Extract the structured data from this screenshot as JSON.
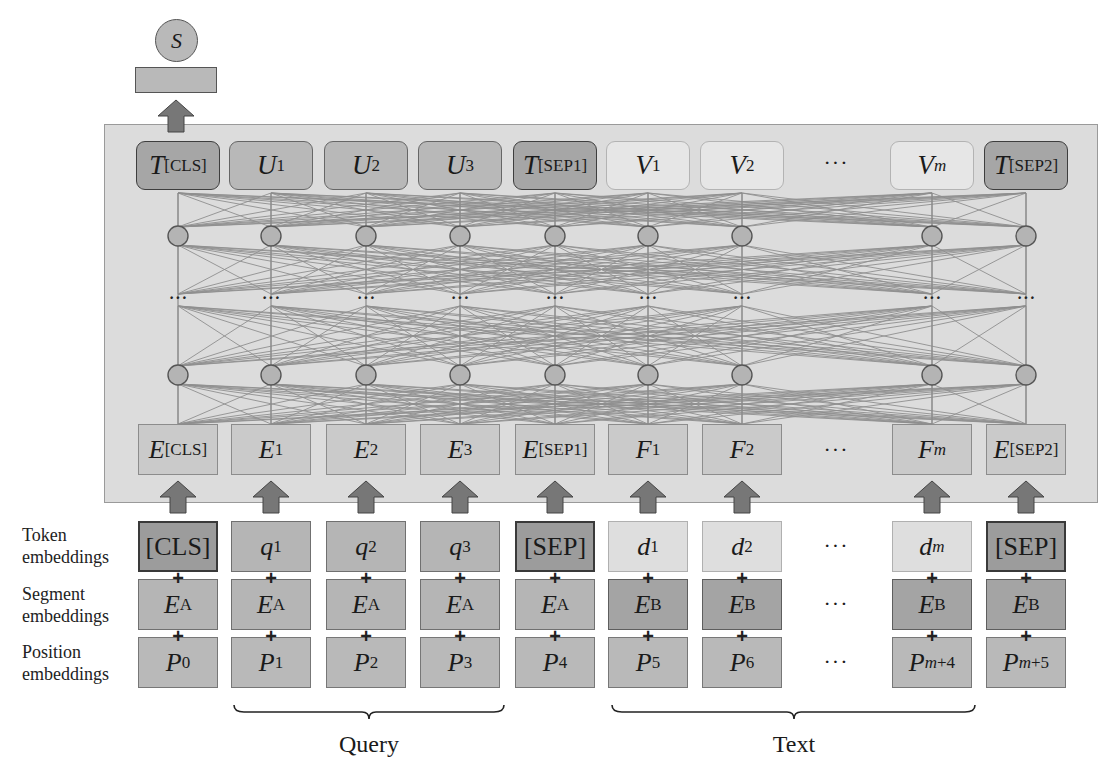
{
  "figure": {
    "output": {
      "score_label": "S"
    },
    "colors": {
      "container_bg": "#dcdcdc",
      "arrow": "#777777",
      "edge": "#8a8a8a",
      "node": "#b4b4b4"
    },
    "output_tokens": [
      {
        "main": "T",
        "sub": "[CLS]",
        "sub_italic": false,
        "shade": "dark"
      },
      {
        "main": "U",
        "sub": "1",
        "sub_italic": false,
        "shade": "mid"
      },
      {
        "main": "U",
        "sub": "2",
        "sub_italic": false,
        "shade": "mid"
      },
      {
        "main": "U",
        "sub": "3",
        "sub_italic": false,
        "shade": "mid"
      },
      {
        "main": "T",
        "sub": "[SEP1]",
        "sub_italic": false,
        "shade": "dark"
      },
      {
        "main": "V",
        "sub": "1",
        "sub_italic": false,
        "shade": "light"
      },
      {
        "main": "V",
        "sub": "2",
        "sub_italic": false,
        "shade": "light"
      },
      {
        "main": "V",
        "sub": "m",
        "sub_italic": true,
        "shade": "light"
      },
      {
        "main": "T",
        "sub": "[SEP2]",
        "sub_italic": false,
        "shade": "dark"
      }
    ],
    "input_embeddings_E": [
      {
        "main": "E",
        "sub": "[CLS]",
        "sub_italic": false
      },
      {
        "main": "E",
        "sub": "1",
        "sub_italic": false
      },
      {
        "main": "E",
        "sub": "2",
        "sub_italic": false
      },
      {
        "main": "E",
        "sub": "3",
        "sub_italic": false
      },
      {
        "main": "E",
        "sub": "[SEP1]",
        "sub_italic": false
      },
      {
        "main": "F",
        "sub": "1",
        "sub_italic": false
      },
      {
        "main": "F",
        "sub": "2",
        "sub_italic": false
      },
      {
        "main": "F",
        "sub": "m",
        "sub_italic": true
      },
      {
        "main": "E",
        "sub": "[SEP2]",
        "sub_italic": false
      }
    ],
    "ellipsis": "···",
    "row_labels": {
      "token": [
        "Token",
        "embeddings"
      ],
      "segment": [
        "Segment",
        "embeddings"
      ],
      "position": [
        "Position",
        "embeddings"
      ]
    },
    "token_embeddings": [
      {
        "main": "[CLS]",
        "sub": "",
        "italic": false,
        "shade": "dark"
      },
      {
        "main": "q",
        "sub": "1",
        "italic": true,
        "shade": "mid"
      },
      {
        "main": "q",
        "sub": "2",
        "italic": true,
        "shade": "mid"
      },
      {
        "main": "q",
        "sub": "3",
        "italic": true,
        "shade": "mid"
      },
      {
        "main": "[SEP]",
        "sub": "",
        "italic": false,
        "shade": "dark"
      },
      {
        "main": "d",
        "sub": "1",
        "italic": true,
        "shade": "light"
      },
      {
        "main": "d",
        "sub": "2",
        "italic": true,
        "shade": "light"
      },
      {
        "main": "d",
        "sub": "m",
        "italic": true,
        "sub_italic": true,
        "shade": "light"
      },
      {
        "main": "[SEP]",
        "sub": "",
        "italic": false,
        "shade": "dark"
      }
    ],
    "segment_embeddings": [
      {
        "main": "E",
        "sub": "A",
        "seg": "a"
      },
      {
        "main": "E",
        "sub": "A",
        "seg": "a"
      },
      {
        "main": "E",
        "sub": "A",
        "seg": "a"
      },
      {
        "main": "E",
        "sub": "A",
        "seg": "a"
      },
      {
        "main": "E",
        "sub": "A",
        "seg": "a"
      },
      {
        "main": "E",
        "sub": "B",
        "seg": "b"
      },
      {
        "main": "E",
        "sub": "B",
        "seg": "b"
      },
      {
        "main": "E",
        "sub": "B",
        "seg": "b"
      },
      {
        "main": "E",
        "sub": "B",
        "seg": "b"
      }
    ],
    "position_embeddings": [
      {
        "main": "P",
        "sub": "0"
      },
      {
        "main": "P",
        "sub": "1"
      },
      {
        "main": "P",
        "sub": "2"
      },
      {
        "main": "P",
        "sub": "3"
      },
      {
        "main": "P",
        "sub": "4"
      },
      {
        "main": "P",
        "sub": "5"
      },
      {
        "main": "P",
        "sub": "6"
      },
      {
        "main": "P",
        "sub": "m+4",
        "sub_italic_m": true
      },
      {
        "main": "P",
        "sub": "m+5",
        "sub_italic_m": true
      }
    ],
    "braces": [
      {
        "label": "Query"
      },
      {
        "label": "Text"
      }
    ],
    "plus_sign": "+"
  }
}
